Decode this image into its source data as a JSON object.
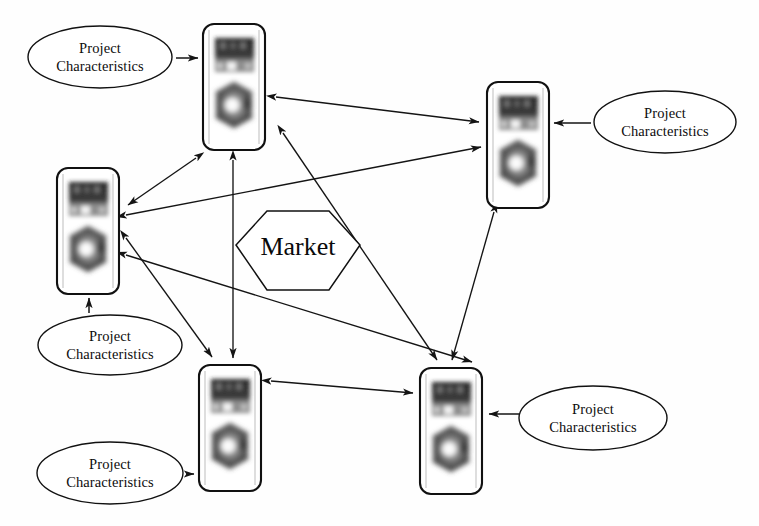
{
  "diagram": {
    "background_color": "#fefefe",
    "stroke_color": "#141414",
    "width": 759,
    "height": 526
  },
  "market": {
    "label": "Market",
    "shape": "hexagon",
    "center": [
      298,
      245
    ],
    "radius": 62
  },
  "ellipses": [
    {
      "id": "pc-top-left",
      "line1": "Project",
      "line2": "Characteristics",
      "center": [
        100,
        57
      ],
      "rx": 72,
      "ry": 31,
      "target_node": "node-top-left",
      "arrow_direction": "right"
    },
    {
      "id": "pc-top-right",
      "line1": "Project",
      "line2": "Characteristics",
      "center": [
        665,
        122
      ],
      "rx": 71,
      "ry": 31,
      "target_node": "node-top-right",
      "arrow_direction": "left"
    },
    {
      "id": "pc-left-mid",
      "line1": "Project",
      "line2": "Characteristics",
      "center": [
        110,
        345
      ],
      "rx": 72,
      "ry": 30,
      "target_node": "node-left-mid",
      "arrow_direction": "up"
    },
    {
      "id": "pc-bottom-left",
      "line1": "Project",
      "line2": "Characteristics",
      "center": [
        110,
        473
      ],
      "rx": 73,
      "ry": 31,
      "target_node": "node-bottom-left",
      "arrow_direction": "right"
    },
    {
      "id": "pc-bottom-right",
      "line1": "Project",
      "line2": "Characteristics",
      "center": [
        593,
        418
      ],
      "rx": 74,
      "ry": 32,
      "target_node": "node-bottom-right",
      "arrow_direction": "left"
    }
  ],
  "nodes": [
    {
      "id": "node-top-left",
      "name": "project-node-top-left",
      "x": 203,
      "y": 24,
      "width": 64,
      "height": 126,
      "icons": [
        "building-photo-icon",
        "hexagon-gear-photo-icon"
      ]
    },
    {
      "id": "node-top-right",
      "name": "project-node-top-right",
      "x": 487,
      "y": 82,
      "width": 60,
      "height": 122,
      "icons": [
        "building-photo-icon",
        "hexagon-gear-photo-icon"
      ]
    },
    {
      "id": "node-left-mid",
      "name": "project-node-left-mid",
      "x": 57,
      "y": 168,
      "width": 62,
      "height": 125,
      "icons": [
        "building-photo-icon",
        "hexagon-gear-photo-icon"
      ]
    },
    {
      "id": "node-bottom-left",
      "name": "project-node-bottom-left",
      "x": 199,
      "y": 365,
      "width": 63,
      "height": 127,
      "icons": [
        "building-photo-icon",
        "hexagon-gear-photo-icon"
      ]
    },
    {
      "id": "node-bottom-right",
      "name": "project-node-bottom-right",
      "x": 420,
      "y": 368,
      "width": 62,
      "height": 126,
      "icons": [
        "building-photo-icon",
        "hexagon-gear-photo-icon"
      ]
    }
  ],
  "links": [
    {
      "from": "node-top-left",
      "to": "node-left-mid",
      "style": "double-arrow"
    },
    {
      "from": "node-top-left",
      "to": "node-bottom-left",
      "style": "double-arrow"
    },
    {
      "from": "node-top-left",
      "to": "node-bottom-right",
      "style": "double-arrow"
    },
    {
      "from": "node-top-left",
      "to": "node-top-right",
      "style": "double-arrow"
    },
    {
      "from": "node-left-mid",
      "to": "node-top-right",
      "style": "double-arrow"
    },
    {
      "from": "node-left-mid",
      "to": "node-bottom-left",
      "style": "double-arrow"
    },
    {
      "from": "node-left-mid",
      "to": "node-bottom-right",
      "style": "double-arrow"
    },
    {
      "from": "node-top-right",
      "to": "node-bottom-right",
      "style": "double-arrow"
    },
    {
      "from": "node-bottom-left",
      "to": "node-bottom-right",
      "style": "double-arrow"
    }
  ]
}
